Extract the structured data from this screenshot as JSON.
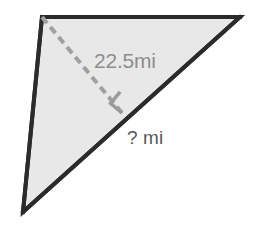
{
  "figure": {
    "kind": "geometry-diagram",
    "shape": "triangle",
    "background_color": "#ffffff",
    "fill_color": "#e8e8e8",
    "outline_color": "#2b2b2b",
    "dashed_color": "#a0a0a0",
    "right_angle_color": "#9a9a9a",
    "outline_width": 4,
    "dash_width": 4,
    "dash_pattern": "8 5",
    "vertices": {
      "top_left": [
        42,
        17
      ],
      "top_right": [
        240,
        17
      ],
      "bottom": [
        23,
        212
      ]
    },
    "altitude": {
      "from": [
        42,
        17
      ],
      "foot": [
        122,
        113
      ],
      "style": "dashed"
    },
    "right_angle_marker": {
      "at": [
        122,
        113
      ],
      "size": 15,
      "rotated": true
    }
  },
  "labels": {
    "altitude_length": "22.5mi",
    "unknown_length": "? mi"
  }
}
